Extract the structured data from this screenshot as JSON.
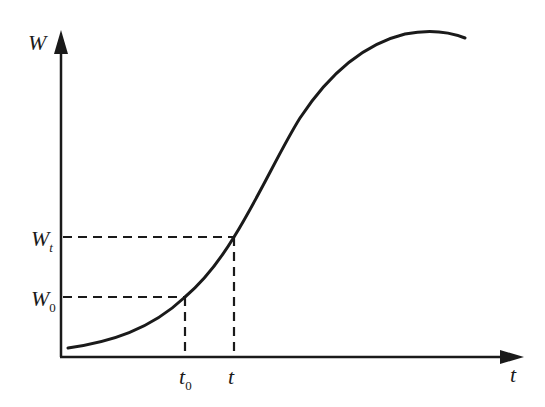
{
  "diagram": {
    "type": "growth-curve",
    "axes": {
      "y_label": "W",
      "x_label": "t"
    },
    "markers": {
      "y": [
        {
          "main": "W",
          "sub": "t"
        },
        {
          "main": "W",
          "sub": "0"
        }
      ],
      "x": [
        {
          "main": "t",
          "sub": "0"
        },
        {
          "main": "t",
          "sub": ""
        }
      ]
    },
    "colors": {
      "line": "#1a1a1a",
      "background": "#ffffff"
    }
  }
}
